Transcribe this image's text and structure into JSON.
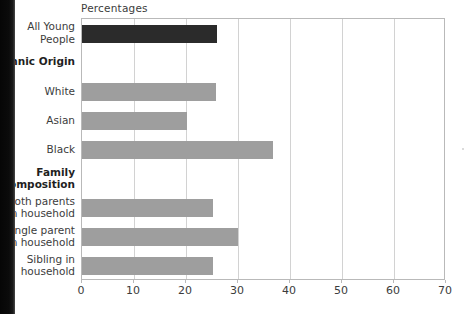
{
  "chart_data": {
    "type": "bar",
    "orientation": "horizontal",
    "title": "Percentages",
    "xlabel": "",
    "ylabel": "",
    "xlim": [
      0,
      70
    ],
    "xticks": [
      0,
      10,
      20,
      30,
      40,
      50,
      60,
      70
    ],
    "grid": true,
    "legend": "none",
    "colors": {
      "highlight_bar": "#2b2b2b",
      "standard_bar": "#9e9e9e",
      "gridline": "#d2d2d2",
      "axis": "#b9b9b9",
      "text": "#3c3c3c"
    },
    "categories": [
      "All Young People",
      "Ethnic Origin",
      "White",
      "Asian",
      "Black",
      "Family Composition",
      "Both parents in household",
      "Single parent in household",
      "Sibling in household"
    ],
    "values": [
      26,
      null,
      25.8,
      20.2,
      36.7,
      null,
      25.2,
      30,
      25.2
    ],
    "rows": [
      {
        "label": "All Young\nPeople",
        "value": 26,
        "kind": "highlight",
        "header": false
      },
      {
        "label": "Ethnic Origin",
        "value": null,
        "kind": "none",
        "header": true
      },
      {
        "label": "White",
        "value": 25.8,
        "kind": "standard",
        "header": false
      },
      {
        "label": "Asian",
        "value": 20.2,
        "kind": "standard",
        "header": false
      },
      {
        "label": "Black",
        "value": 36.7,
        "kind": "standard",
        "header": false
      },
      {
        "label": "Family\nComposition",
        "value": null,
        "kind": "none",
        "header": true
      },
      {
        "label": "Both parents\nin household",
        "value": 25.2,
        "kind": "standard",
        "header": false
      },
      {
        "label": "Single parent\nin household",
        "value": 30,
        "kind": "standard",
        "header": false
      },
      {
        "label": "Sibling in\nhousehold",
        "value": 25.2,
        "kind": "standard",
        "header": false
      }
    ]
  }
}
